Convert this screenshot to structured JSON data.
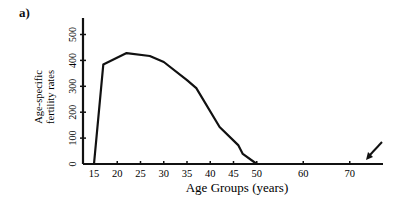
{
  "panel_label": "a)",
  "chart_data": {
    "type": "line",
    "title": "",
    "xlabel": "Age Groups (years)",
    "ylabel": "Age-specific fertility rates",
    "ylabel_lines": [
      "Age-specific",
      "fertility rates"
    ],
    "x_ticks": [
      15,
      20,
      25,
      30,
      35,
      40,
      45,
      50,
      60,
      70
    ],
    "y_ticks": [
      0,
      100,
      200,
      300,
      400,
      500
    ],
    "xlim": [
      13,
      76
    ],
    "ylim": [
      0,
      560
    ],
    "grid": false,
    "legend": null,
    "series": [
      {
        "name": "Age-specific fertility rate",
        "x": [
          15,
          17,
          22,
          27,
          30,
          35,
          37,
          42,
          46,
          47,
          50
        ],
        "y": [
          0,
          384,
          428,
          417,
          394,
          324,
          293,
          143,
          73,
          39,
          0
        ]
      }
    ],
    "annotations": [
      {
        "type": "arrow",
        "pointing_to": "x-axis near 72",
        "description": "arrow pointing down-left toward end of x-axis"
      }
    ],
    "color": "#111111"
  }
}
